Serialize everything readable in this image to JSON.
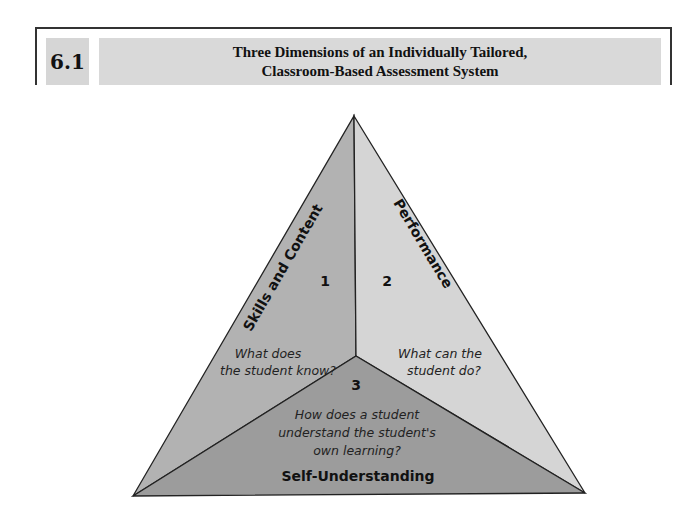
{
  "figure": {
    "number": "6.1",
    "title_line1": "Three Dimensions of an Individually Tailored,",
    "title_line2": "Classroom-Based Assessment System"
  },
  "diagram": {
    "faces": [
      {
        "id": "1",
        "number": "1",
        "label": "Skills and Content",
        "question_line1": "What does",
        "question_line2": "the student know?",
        "color": "#b2b2b2"
      },
      {
        "id": "2",
        "number": "2",
        "label": "Performance",
        "question_line1": "What can the",
        "question_line2": "student do?",
        "color": "#d5d5d5"
      },
      {
        "id": "3",
        "number": "3",
        "label": "Self-Understanding",
        "question_line1": "How does a student",
        "question_line2": "understand the student's",
        "question_line3": "own learning?",
        "color": "#9c9c9c"
      }
    ],
    "edge_color": "#222222"
  }
}
